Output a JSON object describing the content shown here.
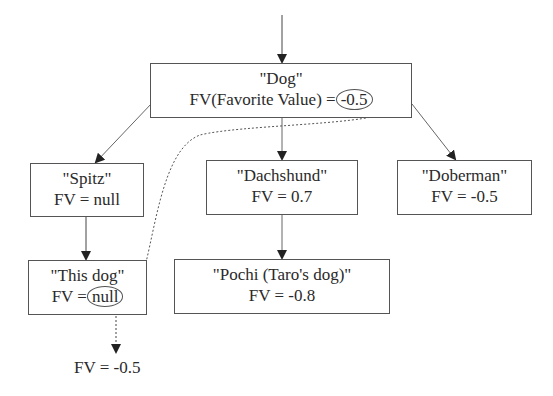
{
  "nodes": {
    "dog": {
      "name": "\"Dog\"",
      "fv_label": "FV(Favorite Value) =",
      "fv_value": "-0.5"
    },
    "spitz": {
      "name": "\"Spitz\"",
      "fv": "FV = null"
    },
    "dachshund": {
      "name": "\"Dachshund\"",
      "fv": "FV = 0.7"
    },
    "doberman": {
      "name": "\"Doberman\"",
      "fv": "FV = -0.5"
    },
    "this_dog": {
      "name": "\"This dog\"",
      "fv_label": "FV =",
      "fv_value": "null"
    },
    "pochi": {
      "name": "\"Pochi (Taro's dog)\"",
      "fv": "FV = -0.8"
    }
  },
  "result": {
    "fv": "FV = -0.5"
  },
  "edges": [
    {
      "from": "top",
      "to": "dog",
      "style": "solid"
    },
    {
      "from": "dog",
      "to": "spitz",
      "style": "solid"
    },
    {
      "from": "dog",
      "to": "dachshund",
      "style": "solid"
    },
    {
      "from": "dog",
      "to": "doberman",
      "style": "solid"
    },
    {
      "from": "spitz",
      "to": "this_dog",
      "style": "solid"
    },
    {
      "from": "dachshund",
      "to": "pochi",
      "style": "solid"
    },
    {
      "from": "dog.fv_value",
      "to": "this_dog.fv_value",
      "style": "dotted"
    },
    {
      "from": "this_dog",
      "to": "result",
      "style": "dotted"
    }
  ]
}
